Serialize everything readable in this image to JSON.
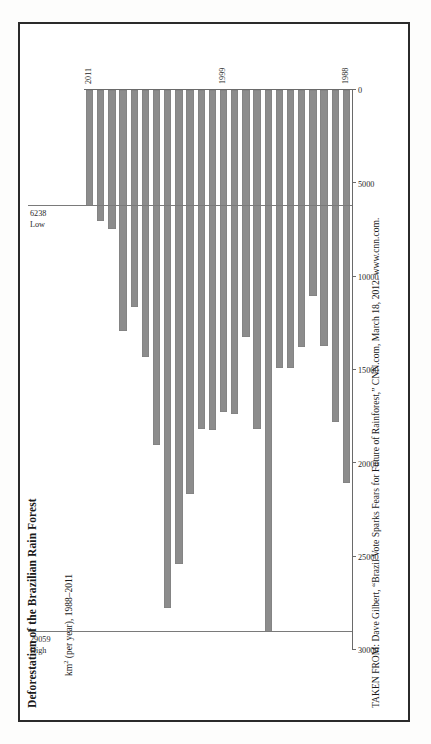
{
  "figure": {
    "title": "Deforestation of the Brazilian Rain Forest",
    "axis_label_html": "km",
    "axis_label_sup": "2",
    "axis_label_rest": " (per year), 1988–2011",
    "caption": "TAKEN FROM: Dave Gilbert, “Brazil Vote Sparks Fears for Future of Rainforest,” CNN.com, March 18, 2012. www.cnn.com.",
    "bar_color": "#8c8c8c",
    "axis_color": "#6a6a6a",
    "page_border_color": "#2b2b2b"
  },
  "annotations": [
    {
      "name": "high",
      "label": "High",
      "value_label": "29059",
      "value": 29059
    },
    {
      "name": "low",
      "label": "Low",
      "value_label": "6238",
      "value": 6238
    }
  ],
  "year_ticks": [
    {
      "label": "2011",
      "index": 23
    },
    {
      "label": "1999",
      "index": 11
    },
    {
      "label": "1988",
      "index": 0
    }
  ],
  "chart_data": {
    "type": "bar",
    "orientation": "horizontal-rotated",
    "title": "Deforestation of the Brazilian Rain Forest",
    "xlabel": "km² (per year), 1988–2011",
    "ylabel": "",
    "value_axis_reversed": true,
    "xlim": [
      0,
      30000
    ],
    "ticks": [
      "30000",
      "25000",
      "20000",
      "15000",
      "10000",
      "5000",
      "0"
    ],
    "tick_values": [
      30000,
      25000,
      20000,
      15000,
      10000,
      5000,
      0
    ],
    "grid": false,
    "legend": "none",
    "categories": [
      "1988",
      "1989",
      "1990",
      "1991",
      "1992",
      "1993",
      "1994",
      "1995",
      "1996",
      "1997",
      "1998",
      "1999",
      "2000",
      "2001",
      "2002",
      "2003",
      "2004",
      "2005",
      "2006",
      "2007",
      "2008",
      "2009",
      "2010",
      "2011"
    ],
    "values": [
      21050,
      17770,
      13730,
      11030,
      13786,
      14896,
      14896,
      29059,
      18161,
      13227,
      17383,
      17259,
      18226,
      18165,
      21651,
      25396,
      27772,
      19014,
      14286,
      11651,
      12911,
      7464,
      7000,
      6238
    ],
    "annotations": [
      {
        "text": "High",
        "value": 29059,
        "category": "1995"
      },
      {
        "text": "Low",
        "value": 6238,
        "category": "2011"
      }
    ]
  }
}
